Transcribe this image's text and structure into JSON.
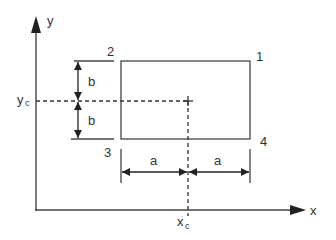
{
  "diagram": {
    "colors": {
      "line": "#444444",
      "text": "#333333",
      "background": "#ffffff"
    },
    "axes": {
      "x_label": "x",
      "y_label": "y"
    },
    "centroid": {
      "x_label": "x",
      "x_sub": "c",
      "y_label": "y",
      "y_sub": "c"
    },
    "corners": {
      "c1": "1",
      "c2": "2",
      "c3": "3",
      "c4": "4"
    },
    "dimensions": {
      "half_height_top": "b",
      "half_height_bottom": "b",
      "half_width_left": "a",
      "half_width_right": "a"
    }
  }
}
